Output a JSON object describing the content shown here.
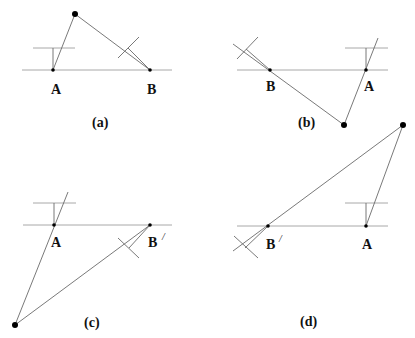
{
  "header_fragment": "Fig. caption (cropped, illegible)",
  "panels": [
    {
      "id": "a",
      "caption": "(a)",
      "labels": {
        "A": "A",
        "B": "B"
      },
      "points": {
        "A": [
          53,
          70
        ],
        "B": [
          150,
          70
        ],
        "P": [
          75,
          14
        ]
      }
    },
    {
      "id": "b",
      "caption": "(b)",
      "labels": {
        "A": "A",
        "B": "B"
      },
      "points": {
        "A": [
          366,
          70
        ],
        "B": [
          270,
          70
        ],
        "P": [
          344,
          125
        ]
      }
    },
    {
      "id": "c",
      "caption": "(c)",
      "labels": {
        "A": "A",
        "B": "B",
        "B_prime": "/"
      },
      "points": {
        "A": [
          54,
          225
        ],
        "B": [
          150,
          225
        ],
        "P": [
          15,
          325
        ]
      }
    },
    {
      "id": "d",
      "caption": "(d)",
      "labels": {
        "A": "A",
        "B": "B",
        "B_prime": "/"
      },
      "points": {
        "A": [
          366,
          226
        ],
        "B": [
          268,
          226
        ],
        "P": [
          403,
          125
        ]
      }
    }
  ]
}
